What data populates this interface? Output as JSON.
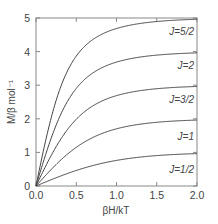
{
  "chart_data": {
    "type": "line",
    "title": "",
    "xlabel": "βH/kT",
    "ylabel": "M/β mol⁻¹",
    "xlim": [
      0.0,
      2.0
    ],
    "ylim": [
      0,
      5
    ],
    "grid": false,
    "legend": "inline labels at right end of each curve",
    "x_ticks": [
      "0.0",
      "0.5",
      "1.0",
      "1.5",
      "2.0"
    ],
    "y_ticks": [
      "0",
      "1",
      "2",
      "3",
      "4",
      "5"
    ],
    "x": [
      0.0,
      0.25,
      0.5,
      0.75,
      1.0,
      1.25,
      1.5,
      1.75,
      2.0
    ],
    "series": [
      {
        "name": "J=5/2",
        "J": 2.5,
        "label_y": 4.6,
        "values": [
          0,
          2.55,
          3.87,
          4.43,
          4.69,
          4.82,
          4.9,
          4.94,
          4.96
        ]
      },
      {
        "name": "J=2",
        "J": 2.0,
        "label_y": 3.6,
        "values": [
          0,
          1.81,
          2.9,
          3.43,
          3.69,
          3.82,
          3.9,
          3.94,
          3.96
        ]
      },
      {
        "name": "J=3/2",
        "J": 1.5,
        "label_y": 2.6,
        "values": [
          0,
          1.17,
          1.99,
          2.45,
          2.69,
          2.82,
          2.9,
          2.94,
          2.96
        ]
      },
      {
        "name": "J=1",
        "J": 1.0,
        "label_y": 1.5,
        "values": [
          0,
          0.64,
          1.15,
          1.49,
          1.7,
          1.83,
          1.9,
          1.94,
          1.96
        ]
      },
      {
        "name": "J=1/2",
        "J": 0.5,
        "label_y": 0.5,
        "values": [
          0,
          0.25,
          0.46,
          0.64,
          0.76,
          0.85,
          0.91,
          0.94,
          0.96
        ]
      }
    ]
  },
  "plot": {
    "frame_color": "#888888",
    "line_color": "#444444"
  }
}
